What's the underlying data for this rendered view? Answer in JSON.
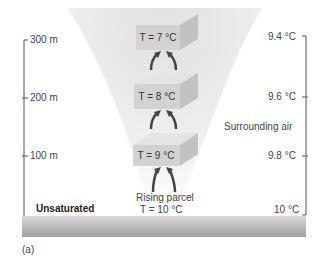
{
  "diagram": {
    "panel_label": "(a)",
    "condition_label": "Unsaturated",
    "surrounding_label": "Surrounding air",
    "parcel_caption": "Rising parcel",
    "parcel_base_temp": "T = 10 °C",
    "altitudes": [
      {
        "label": "300 m",
        "parcel_temp": "T = 7 °C",
        "air_temp": "9.4 °C"
      },
      {
        "label": "200 m",
        "parcel_temp": "T = 8 °C",
        "air_temp": "9.6 °C"
      },
      {
        "label": "100 m",
        "parcel_temp": "T = 9 °C",
        "air_temp": "9.8 °C"
      }
    ],
    "ground_air_temp": "10 °C",
    "colors": {
      "funnel": "#e6e6e6",
      "box_front": "#cfcfcf",
      "box_top": "#e2e2e2",
      "box_side": "#bdbdbd",
      "arrow": "#444444",
      "ground": "#a8a8a8",
      "axis": "#555555"
    }
  }
}
